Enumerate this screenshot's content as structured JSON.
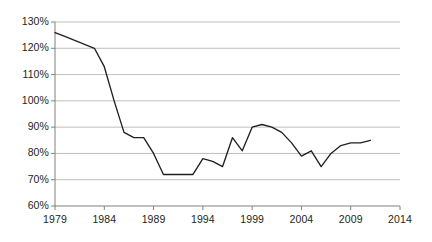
{
  "chart_data": {
    "type": "line",
    "title": "",
    "xlabel": "",
    "ylabel": "",
    "xlim": [
      1979,
      2014
    ],
    "ylim": [
      60,
      130
    ],
    "grid": true,
    "legend": false,
    "legend_position": "none",
    "y_tick_labels": [
      "130%",
      "120%",
      "110%",
      "100%",
      "90%",
      "80%",
      "70%",
      "60%"
    ],
    "y_ticks": [
      130,
      120,
      110,
      100,
      90,
      80,
      70,
      60
    ],
    "x_tick_labels": [
      "1979",
      "1984",
      "1989",
      "1994",
      "1999",
      "2004",
      "2009",
      "2014"
    ],
    "x_ticks": [
      1979,
      1984,
      1989,
      1994,
      1999,
      2004,
      2009,
      2014
    ],
    "line_color": "#231f20",
    "grid_color": "#bfbfbf",
    "axis_color": "#808080",
    "series": [
      {
        "name": "series-1",
        "x": [
          1979,
          1980,
          1981,
          1982,
          1983,
          1984,
          1985,
          1986,
          1987,
          1988,
          1989,
          1990,
          1991,
          1992,
          1993,
          1994,
          1995,
          1996,
          1997,
          1998,
          1999,
          2000,
          2001,
          2002,
          2003,
          2004,
          2005,
          2006,
          2007,
          2008,
          2009,
          2010,
          2011
        ],
        "values": [
          126,
          124.5,
          123,
          121.5,
          120,
          113,
          100,
          88,
          86,
          86,
          80,
          72,
          72,
          72,
          72,
          78,
          77,
          75,
          86,
          81,
          90,
          91,
          90,
          88,
          84,
          79,
          81,
          75,
          80,
          83,
          84,
          84,
          85
        ]
      }
    ]
  }
}
